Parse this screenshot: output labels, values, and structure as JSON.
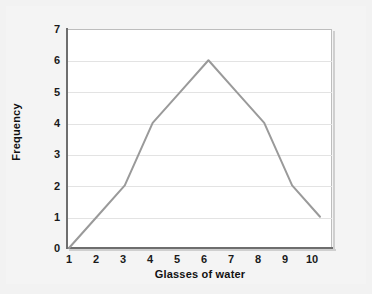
{
  "chart_data": {
    "type": "line",
    "title": "",
    "xlabel": "Glasses of water",
    "ylabel": "Frequency",
    "x": [
      1,
      2,
      3,
      4,
      5,
      6,
      7,
      8,
      9,
      10
    ],
    "values": [
      0,
      1,
      2,
      4,
      5,
      6,
      5,
      4,
      2,
      1
    ],
    "series": [
      {
        "name": "Frequency",
        "values": [
          0,
          1,
          2,
          4,
          5,
          6,
          5,
          4,
          2,
          1
        ]
      }
    ],
    "x_tick_labels": [
      "1",
      "2",
      "3",
      "4",
      "5",
      "6",
      "7",
      "8",
      "9",
      "10"
    ],
    "y_tick_labels": [
      "0",
      "1",
      "2",
      "3",
      "4",
      "5",
      "6",
      "7"
    ],
    "y_ticks": [
      0,
      1,
      2,
      3,
      4,
      5,
      6,
      7
    ],
    "xlim": [
      1,
      10
    ],
    "ylim": [
      0,
      7
    ],
    "grid": "horizontal",
    "legend": "none",
    "colors": {
      "line": "#9a9a9a",
      "gridline": "#e3e3e3",
      "axis": "#6e6e6e",
      "plot_background": "#ffffff",
      "figure_background": "#f2f2f2",
      "text": "#111111"
    },
    "line_width": 2,
    "markers": "none"
  }
}
